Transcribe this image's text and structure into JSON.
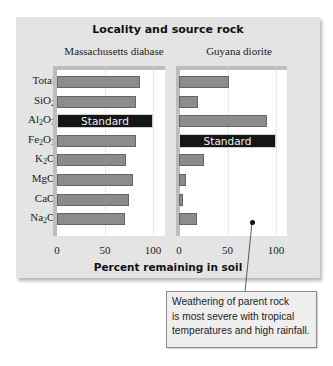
{
  "chart_data": {
    "type": "bar",
    "orientation": "horizontal",
    "title": "Locality and source rock",
    "xlabel": "Percent remaining in soil",
    "ylabel": "",
    "xlim": [
      0,
      100
    ],
    "xticks": [
      "0",
      "50",
      "100"
    ],
    "grid": true,
    "categories": [
      "Total",
      "SiO2",
      "Al2O3",
      "Fe2O3",
      "K2O",
      "MgO",
      "CaO",
      "Na2O"
    ],
    "category_labels_html": [
      "Total",
      "SiO<sub>2</sub>",
      "Al<sub>2</sub>O<sub>3</sub>",
      "Fe<sub>2</sub>O<sub>3</sub>",
      "K<sub>2</sub>O",
      "MgO",
      "CaO",
      "Na<sub>2</sub>O"
    ],
    "series": [
      {
        "name": "Massachusetts diabase",
        "values": [
          86,
          82,
          100,
          82,
          72,
          79,
          75,
          71
        ],
        "standard_index": 2,
        "standard_label": "Standard"
      },
      {
        "name": "Guyana diorite",
        "values": [
          52,
          20,
          91,
          100,
          26,
          7,
          4,
          19
        ],
        "standard_index": 3,
        "standard_label": "Standard"
      }
    ],
    "annotation": "Weathering of parent rock is most severe with tropical temperatures and high rainfall.",
    "colors": {
      "bar": "#8c8c8c",
      "standard_bar": "#161616",
      "panel_background": "#e4e4e4",
      "plot_background": "#ffffff"
    }
  },
  "callout": {
    "lines": [
      "Weathering of parent rock",
      "is most severe with tropical",
      "temperatures and high rainfall."
    ]
  }
}
